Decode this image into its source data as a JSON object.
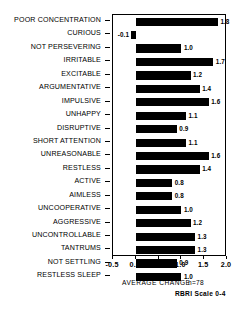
{
  "chart_data": {
    "type": "bar",
    "orientation": "horizontal",
    "title": "",
    "xlabel": "AVERAGE CHANGE",
    "ylabel": "",
    "xlim": [
      -0.5,
      2.0
    ],
    "xticks": [
      -0.5,
      0.0,
      0.5,
      1.0,
      1.5,
      2.0
    ],
    "xtick_labels": [
      "-0.5",
      "0.0",
      "0.5",
      "1.0",
      "1.5",
      "2.0"
    ],
    "grid": false,
    "legend": null,
    "bar_color": "#000000",
    "categories": [
      "POOR CONCENTRATION",
      "CURIOUS",
      "NOT PERSEVERING",
      "IRRITABLE",
      "EXCITABLE",
      "ARGUMENTATIVE",
      "IMPULSIVE",
      "UNHAPPY",
      "DISRUPTIVE",
      "SHORT ATTENTION",
      "UNREASONABLE",
      "RESTLESS",
      "ACTIVE",
      "AIMLESS",
      "UNCOOPERATIVE",
      "AGGRESSIVE",
      "UNCONTROLLABLE",
      "TANTRUMS",
      "NOT SETTLING",
      "RESTLESS SLEEP"
    ],
    "values": [
      1.8,
      -0.1,
      1.0,
      1.7,
      1.2,
      1.4,
      1.6,
      1.1,
      0.9,
      1.1,
      1.6,
      1.4,
      0.8,
      0.8,
      1.0,
      1.2,
      1.3,
      1.3,
      0.9,
      1.0
    ],
    "value_labels": [
      "1.8",
      "-0.1",
      "1.0",
      "1.7",
      "1.2",
      "1.4",
      "1.6",
      "1.1",
      "0.9",
      "1.1",
      "1.6",
      "1.4",
      "0.8",
      "0.8",
      "1.0",
      "1.2",
      "1.3",
      "1.3",
      "0.9",
      "1.0"
    ],
    "annotations": {
      "sample_size": "n=78",
      "scale_note": "RBRI Scale 0-4"
    }
  }
}
